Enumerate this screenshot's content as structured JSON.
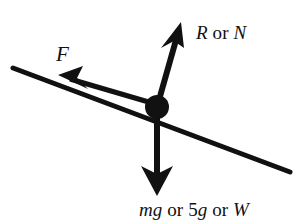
{
  "diagram": {
    "type": "free-body-diagram",
    "background_color": "#ffffff",
    "stroke_color": "#111111",
    "surface": {
      "name": "inclined-plane-line",
      "from": [
        13,
        68
      ],
      "to": [
        290,
        172
      ],
      "angle_deg": -20.6
    },
    "particle": {
      "name": "particle-dot",
      "center": [
        157,
        107
      ],
      "radius": 12
    },
    "forces": [
      {
        "id": "friction",
        "label_parts": [
          {
            "text": "F",
            "style": "italic"
          }
        ],
        "label_text": "F",
        "from": [
          152,
          103
        ],
        "to": [
          58,
          75
        ],
        "direction": "up-the-slope"
      },
      {
        "id": "normal",
        "label_parts": [
          {
            "text": "R",
            "style": "italic"
          },
          {
            "text": " or ",
            "style": "roman"
          },
          {
            "text": "N",
            "style": "italic"
          }
        ],
        "label_text": "R or N",
        "from": [
          160,
          99
        ],
        "to": [
          181,
          24
        ],
        "direction": "perpendicular-to-slope"
      },
      {
        "id": "weight",
        "label_parts": [
          {
            "text": "mg",
            "style": "italic"
          },
          {
            "text": " or 5",
            "style": "roman"
          },
          {
            "text": "g",
            "style": "italic"
          },
          {
            "text": " or ",
            "style": "roman"
          },
          {
            "text": "W",
            "style": "italic"
          }
        ],
        "label_text": "mg or 5g or W",
        "from": [
          157,
          115
        ],
        "to": [
          157,
          196
        ],
        "direction": "vertically-down"
      }
    ]
  }
}
